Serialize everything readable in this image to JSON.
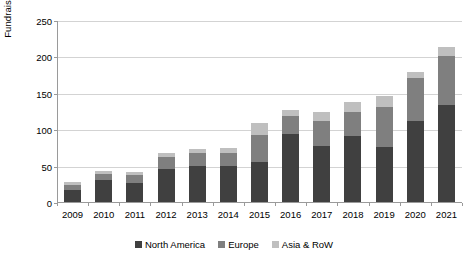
{
  "chart_data": {
    "type": "bar",
    "subtype": "stacked-bar",
    "title": "",
    "xlabel": "",
    "ylabel": "Fundraising in $B",
    "ylim": [
      0,
      250
    ],
    "yticks": [
      0,
      50,
      100,
      150,
      200,
      250
    ],
    "grid": true,
    "legend_position": "bottom-center",
    "categories": [
      "2009",
      "2010",
      "2011",
      "2012",
      "2013",
      "2014",
      "2015",
      "2016",
      "2017",
      "2018",
      "2019",
      "2020",
      "2021"
    ],
    "series": [
      {
        "name": "North America",
        "color": "#404040",
        "values": [
          17,
          30,
          26,
          46,
          50,
          50,
          55,
          93,
          77,
          91,
          75,
          111,
          133
        ]
      },
      {
        "name": "Europe",
        "color": "#7f7f7f",
        "values": [
          7,
          9,
          11,
          16,
          17,
          17,
          37,
          25,
          34,
          32,
          55,
          59,
          67
        ]
      },
      {
        "name": "Asia & RoW",
        "color": "#bfbfbf",
        "values": [
          3,
          4,
          4,
          6,
          6,
          7,
          16,
          9,
          12,
          14,
          15,
          8,
          13
        ]
      }
    ],
    "totals": [
      27,
      43,
      41,
      68,
      73,
      74,
      108,
      127,
      123,
      137,
      145,
      178,
      213
    ]
  },
  "legend": {
    "items": [
      {
        "label": "North America",
        "color": "#404040"
      },
      {
        "label": "Europe",
        "color": "#7f7f7f"
      },
      {
        "label": "Asia & RoW",
        "color": "#bfbfbf"
      }
    ]
  },
  "axis": {
    "y_title": "Fundraising in $B"
  }
}
